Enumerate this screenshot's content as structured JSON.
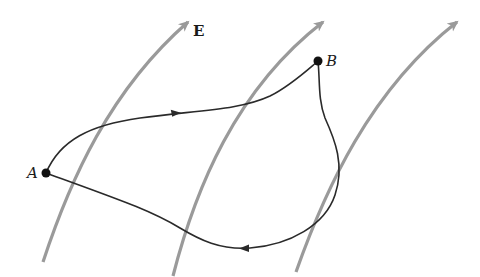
{
  "diagram": {
    "field_label": "E",
    "point_a_label": "A",
    "point_b_label": "B",
    "colors": {
      "field_lines": "#9a9a9a",
      "path": "#2a2a2a",
      "points": "#111111",
      "background": "#ffffff"
    },
    "field_lines_count": 3,
    "paths": [
      {
        "name": "upper-path",
        "from": "A",
        "to": "B",
        "arrow_direction": "toward B"
      },
      {
        "name": "lower-path",
        "from": "B",
        "to": "A",
        "arrow_direction": "toward A"
      }
    ]
  }
}
